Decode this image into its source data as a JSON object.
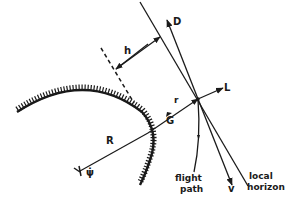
{
  "diagram": {
    "type": "flight-mechanics-geometry",
    "colors": {
      "ink": "#1a1a1a",
      "background": "#ffffff"
    },
    "labels": {
      "h": "h",
      "D": "D",
      "L": "L",
      "r": "r",
      "G": "G",
      "R": "R",
      "psi_dot": "ψ̇",
      "v": "v",
      "flight_path_line1": "flight",
      "flight_path_line2": "path",
      "local_horizon_line1": "local",
      "local_horizon_line2": "horizon"
    },
    "elements": [
      "planet-surface-arc",
      "radius-R",
      "altitude-h",
      "drag-vector-D",
      "lift-vector-L",
      "gravity-vector-G",
      "velocity-vector-v",
      "flight-path",
      "local-horizon"
    ]
  }
}
